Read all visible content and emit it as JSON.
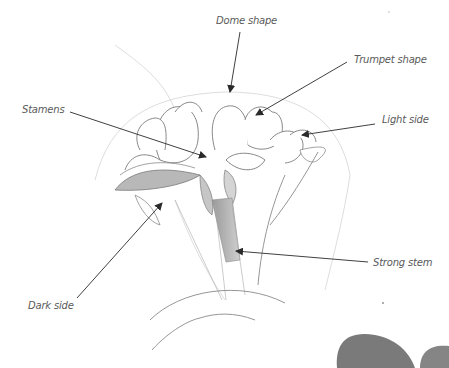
{
  "figure": {
    "labels": {
      "dome_shape": "Dome shape",
      "trumpet_shape": "Trumpet shape",
      "stamens": "Stamens",
      "light_side": "Light side",
      "strong_stem": "Strong stem",
      "dark_side": "Dark side"
    },
    "colors": {
      "background": "#ffffff",
      "label_text": "#5a5a5a",
      "arrow": "#2a2a2a",
      "sketch_line": "#8a8a8a",
      "shadow_shape": "#7a7a7a"
    }
  }
}
